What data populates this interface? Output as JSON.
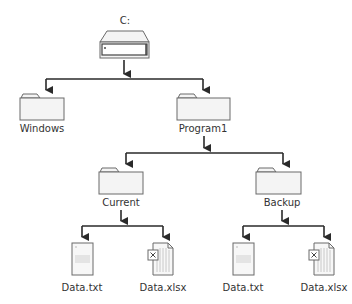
{
  "diagram": {
    "type": "directory-tree",
    "colors": {
      "line": "#2a2a2a",
      "icon_stroke": "#6a6a6a",
      "icon_fill": "#f4f4f4",
      "label": "#333333",
      "drive_slot": "#444444"
    },
    "root": {
      "label": "C:",
      "icon": "hard-drive-icon"
    },
    "level1": [
      {
        "label": "Windows",
        "icon": "folder-icon"
      },
      {
        "label": "Program1",
        "icon": "folder-icon"
      }
    ],
    "level2": [
      {
        "label": "Current",
        "icon": "folder-icon"
      },
      {
        "label": "Backup",
        "icon": "folder-icon"
      }
    ],
    "level3": [
      {
        "label": "Data.txt",
        "icon": "text-document-icon",
        "parent": "Current"
      },
      {
        "label": "Data.xlsx",
        "icon": "spreadsheet-document-icon",
        "parent": "Current"
      },
      {
        "label": "Data.txt",
        "icon": "text-document-icon",
        "parent": "Backup"
      },
      {
        "label": "Data.xlsx",
        "icon": "spreadsheet-document-icon",
        "parent": "Backup"
      }
    ]
  }
}
